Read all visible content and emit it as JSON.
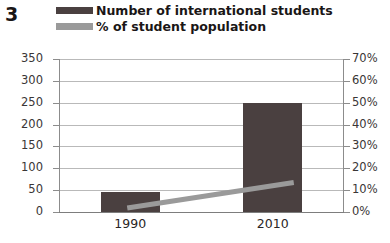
{
  "figure_number": "3",
  "legend": {
    "entries": [
      {
        "label": "Number of international students",
        "marker": "bar-swatch",
        "color": "#4a4040"
      },
      {
        "label": "% of student population",
        "marker": "line-swatch",
        "color": "#9a9a9a"
      }
    ]
  },
  "axes": {
    "left_ticks": [
      "350",
      "300",
      "250",
      "200",
      "150",
      "100",
      "50",
      "0"
    ],
    "right_ticks": [
      "70%",
      "60%",
      "50%",
      "40%",
      "30%",
      "20%",
      "10%",
      "0%"
    ],
    "category_labels": [
      "1990",
      "2010"
    ]
  },
  "chart_data": {
    "type": "bar",
    "title": "",
    "subtitle": "",
    "xlabel": "",
    "ylabel": "",
    "y2label": "",
    "categories": [
      "1990",
      "2010"
    ],
    "series": [
      {
        "name": "Number of international students",
        "type": "bar",
        "axis": "left",
        "color": "#4a4040",
        "values": [
          45,
          250
        ]
      },
      {
        "name": "% of student population",
        "type": "line",
        "axis": "right",
        "color": "#9a9a9a",
        "values": [
          2,
          12
        ]
      }
    ],
    "ylim": [
      0,
      350
    ],
    "ytick_step": 50,
    "y2lim": [
      0,
      70
    ],
    "y2tick_step": 10,
    "y2_unit": "%",
    "grid": true,
    "legend_position": "top"
  }
}
